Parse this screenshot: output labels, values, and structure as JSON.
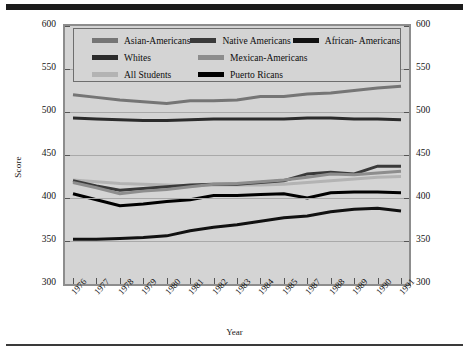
{
  "figure": {
    "y_axis_label": "Score",
    "x_axis_label": "Year"
  },
  "legend": {
    "entries": [
      {
        "label": "Asian-Americans",
        "color": "#757575"
      },
      {
        "label": "Native Americans",
        "color": "#3a3a3a"
      },
      {
        "label": "African- Americans",
        "color": "#111111"
      },
      {
        "label": "Whites",
        "color": "#2b2b2b"
      },
      {
        "label": "Mexican-Americans",
        "color": "#8d8d8d"
      },
      {
        "label": "All Students",
        "color": "#b3b3b3"
      },
      {
        "label": "Puerto Ricans",
        "color": "#000000"
      }
    ]
  },
  "chart_data": {
    "type": "line",
    "title": "",
    "xlabel": "Year",
    "ylabel": "Score",
    "ylim": [
      300,
      600
    ],
    "ytick_labels": [
      "300",
      "350",
      "400",
      "450",
      "500",
      "550",
      "600"
    ],
    "yticks": [
      300,
      350,
      400,
      450,
      500,
      550,
      600
    ],
    "grid": true,
    "legend_position": "top-inside",
    "categories": [
      "1976",
      "1977",
      "1978",
      "1979",
      "1980",
      "1981",
      "1982",
      "1983",
      "1984",
      "1985",
      "1987",
      "1988",
      "1989",
      "1990",
      "1991"
    ],
    "x": [
      "1976",
      "1977",
      "1978",
      "1979",
      "1980",
      "1981",
      "1982",
      "1983",
      "1984",
      "1985",
      "1987",
      "1988",
      "1989",
      "1990",
      "1991"
    ],
    "series": [
      {
        "name": "Asian-Americans",
        "color": "#757575",
        "values": [
          520,
          517,
          514,
          512,
          510,
          513,
          513,
          514,
          518,
          518,
          521,
          522,
          525,
          528,
          530
        ]
      },
      {
        "name": "Whites",
        "color": "#2b2b2b",
        "values": [
          493,
          492,
          491,
          490,
          490,
          491,
          492,
          492,
          492,
          492,
          493,
          493,
          492,
          492,
          491
        ]
      },
      {
        "name": "All Students",
        "color": "#b3b3b3",
        "values": [
          421,
          419,
          417,
          416,
          415,
          414,
          415,
          415,
          415,
          416,
          418,
          420,
          422,
          424,
          425
        ]
      },
      {
        "name": "Native Americans",
        "color": "#3a3a3a",
        "values": [
          420,
          414,
          409,
          411,
          413,
          415,
          416,
          416,
          418,
          420,
          428,
          430,
          428,
          437,
          437
        ]
      },
      {
        "name": "Mexican-Americans",
        "color": "#8d8d8d",
        "values": [
          418,
          412,
          405,
          408,
          410,
          413,
          416,
          417,
          419,
          421,
          424,
          428,
          427,
          429,
          431
        ]
      },
      {
        "name": "Puerto Ricans",
        "color": "#000000",
        "values": [
          405,
          398,
          391,
          393,
          396,
          398,
          403,
          403,
          404,
          405,
          400,
          406,
          407,
          407,
          406
        ]
      },
      {
        "name": "African- Americans",
        "color": "#111111",
        "values": [
          352,
          352,
          353,
          354,
          356,
          362,
          366,
          369,
          373,
          377,
          379,
          384,
          387,
          388,
          385
        ]
      }
    ]
  }
}
